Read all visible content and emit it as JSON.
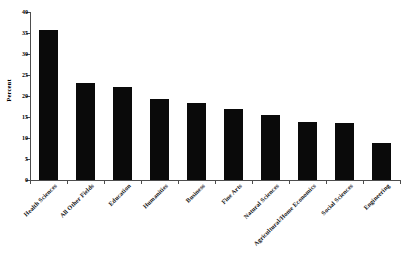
{
  "chart_data": {
    "type": "bar",
    "title": "",
    "xlabel": "",
    "ylabel": "Percent",
    "ylim": [
      0,
      40
    ],
    "yticks": [
      0,
      5,
      10,
      15,
      20,
      25,
      30,
      35,
      40
    ],
    "ytick_labels": [
      "0",
      "5",
      "10",
      "15",
      "20",
      "25",
      "30",
      "35",
      "40"
    ],
    "grid": false,
    "legend": false,
    "bar_color": "#0a0a0a",
    "axis_color": "#4d4d4d",
    "categories": [
      "Health Sciences",
      "All Other Fields",
      "Education",
      "Humanities",
      "Business",
      "Fine Arts",
      "Natural Sciences",
      "Agricultural/Home Economics",
      "Social Sciences",
      "Engineering"
    ],
    "values": [
      35.6,
      23.1,
      22.1,
      19.4,
      18.3,
      17.0,
      15.5,
      13.9,
      13.5,
      8.9
    ]
  }
}
